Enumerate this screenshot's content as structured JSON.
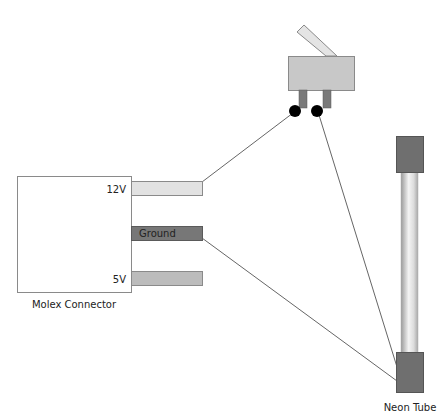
{
  "connector": {
    "title": "Molex Connector",
    "pins": [
      {
        "label": "12V",
        "color": "#e2e2e2"
      },
      {
        "label": "Ground",
        "color": "#777777"
      },
      {
        "label": "5V",
        "color": "#bcbcbc"
      }
    ]
  },
  "switch": {
    "body_color": "#c8c8c8",
    "lever_color": "#e4e4e4",
    "pin_color": "#7a7a7a",
    "terminal_color": "#000000"
  },
  "neon_tube": {
    "title": "Neon Tube",
    "cap_color": "#6f6f6f"
  },
  "wire_color": "#666666"
}
